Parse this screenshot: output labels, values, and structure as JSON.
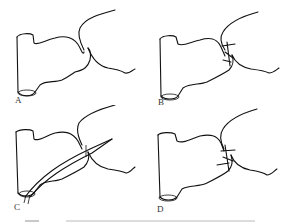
{
  "figure": {
    "panels": [
      {
        "id": "A",
        "label": "A",
        "state": "anatomy"
      },
      {
        "id": "B",
        "label": "B",
        "state": "sutured"
      },
      {
        "id": "C",
        "label": "C",
        "state": "needle-inserted"
      },
      {
        "id": "D",
        "label": "D",
        "state": "sutured-tied"
      }
    ],
    "caption": ""
  }
}
